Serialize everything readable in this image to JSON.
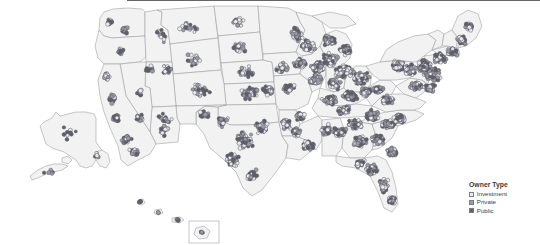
{
  "figure": {
    "type": "dot-distribution-map",
    "region": "United States",
    "background_color": "#ffffff",
    "state_fill_color": "#f2f2f2",
    "state_border_color": "#9a9a9a"
  },
  "legend": {
    "title": "Owner Type",
    "items": [
      {
        "label": "Investment",
        "color": "#ececf1"
      },
      {
        "label": "Private",
        "color": "#9b9ba6"
      },
      {
        "label": "Public",
        "color": "#61616d"
      }
    ]
  },
  "insets": [
    {
      "name": "Alaska"
    },
    {
      "name": "Hawaii"
    }
  ],
  "chart_data": {
    "type": "scatter",
    "title": "",
    "xlabel": "",
    "ylabel": "",
    "legend_position": "bottom-right",
    "grid": false,
    "projection": "albers-usa",
    "categories": [
      "Investment",
      "Private",
      "Public"
    ],
    "series": [
      {
        "name": "Investment",
        "color": "#ececf1",
        "marker": "circle"
      },
      {
        "name": "Private",
        "color": "#9b9ba6",
        "marker": "circle"
      },
      {
        "name": "Public",
        "color": "#61616d",
        "marker": "circle"
      }
    ]
  }
}
